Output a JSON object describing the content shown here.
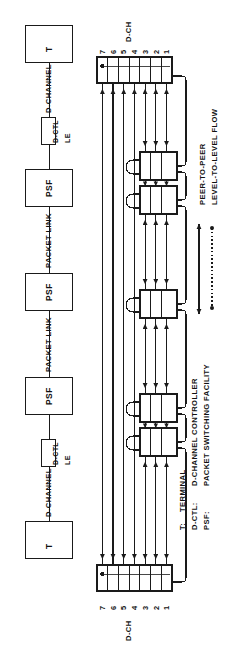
{
  "figure": {
    "orientation": "rotated-90-ccw",
    "type": "layered-protocol-architecture-diagram",
    "ink_color": "#1a1a1a",
    "background": "#ffffff"
  },
  "topology": {
    "node_labels": [
      "T",
      "PSF",
      "PSF",
      "PSF",
      "T"
    ],
    "link_labels": [
      "D-CHANNEL",
      "PACKET LINK",
      "PACKET LINK",
      "D-CHANNEL"
    ],
    "interface_box_label": "D-CTL",
    "interface_sub_label": "LE",
    "terminal_label": "T",
    "psf_label": "PSF"
  },
  "stacks": {
    "endpoint_layer_labels": [
      "7",
      "6",
      "5",
      "4",
      "3",
      "2",
      "1"
    ],
    "endpoint_axis_label": "D-CH",
    "endpoint_layer_count": 7,
    "relay_layer_labels": [
      "3",
      "2",
      "1"
    ],
    "relay_layer_count": 3,
    "relay_stack_count": 5
  },
  "legend_flow": {
    "items": [
      {
        "label": "PEER-TO-PEER",
        "symbol": "double-headed-solid-arrow"
      },
      {
        "label": "LEVEL-TO-LEVEL FLOW",
        "symbol": "dotted-line-with-dot-ends"
      }
    ]
  },
  "legend_keys": {
    "entries": [
      {
        "abbr": "T:",
        "meaning": "TERMINAL"
      },
      {
        "abbr": "D-CTL:",
        "meaning": "D-CHANNEL CONTROLLER"
      },
      {
        "abbr": "PSF:",
        "meaning": "PACKET SWITCHING FACILITY"
      }
    ]
  }
}
